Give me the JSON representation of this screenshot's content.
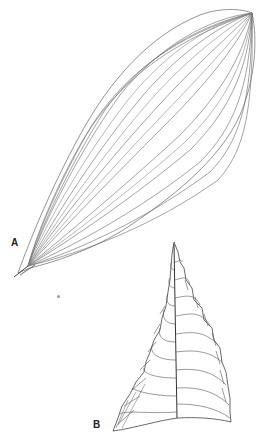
{
  "figure": {
    "panels": [
      {
        "id": "A",
        "label": "A",
        "description": "elongate leaf with parallel, converging longitudinal venation"
      },
      {
        "id": "B",
        "label": "B",
        "description": "triangular pinnate leaf with midrib and branching lateral veins"
      }
    ],
    "colors": {
      "background": "#ffffff",
      "line": "#555555",
      "label": "#222222"
    }
  }
}
